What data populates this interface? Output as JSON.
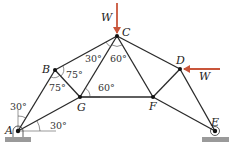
{
  "figure": {
    "type": "truss-diagram",
    "colors": {
      "member": "#2a2a2a",
      "load_arrow": "#c9553a",
      "ground": "#9a9a9a",
      "background": "#ffffff"
    },
    "nodes": [
      {
        "id": "A",
        "label": "A",
        "x": 18,
        "y": 131
      },
      {
        "id": "B",
        "label": "B",
        "x": 55,
        "y": 70
      },
      {
        "id": "C",
        "label": "C",
        "x": 117,
        "y": 36
      },
      {
        "id": "D",
        "label": "D",
        "x": 180,
        "y": 69
      },
      {
        "id": "E",
        "label": "E",
        "x": 215,
        "y": 131
      },
      {
        "id": "F",
        "label": "F",
        "x": 153,
        "y": 97
      },
      {
        "id": "G",
        "label": "G",
        "x": 80,
        "y": 97
      }
    ],
    "members": [
      [
        "A",
        "B"
      ],
      [
        "B",
        "C"
      ],
      [
        "C",
        "D"
      ],
      [
        "D",
        "E"
      ],
      [
        "A",
        "G"
      ],
      [
        "G",
        "F"
      ],
      [
        "F",
        "E"
      ],
      [
        "B",
        "G"
      ],
      [
        "C",
        "G"
      ],
      [
        "C",
        "F"
      ],
      [
        "D",
        "F"
      ]
    ],
    "loads": [
      {
        "node": "C",
        "label": "W",
        "direction": "down"
      },
      {
        "node": "D",
        "label": "W",
        "direction": "left"
      }
    ],
    "supports": [
      {
        "node": "A",
        "type": "pin"
      },
      {
        "node": "E",
        "type": "roller"
      }
    ],
    "angles": [
      {
        "label": "30°",
        "where": "at A, between AB and vertical"
      },
      {
        "label": "30°",
        "where": "at A, between AG and horizontal"
      },
      {
        "label": "75°",
        "where": "at B, between BC and BG"
      },
      {
        "label": "75°",
        "where": "at B, between BA and BG"
      },
      {
        "label": "30°",
        "where": "at C, between CB and CG"
      },
      {
        "label": "60°",
        "where": "at C, between CG and CF"
      },
      {
        "label": "60°",
        "where": "at G, between GC and GF"
      }
    ]
  }
}
